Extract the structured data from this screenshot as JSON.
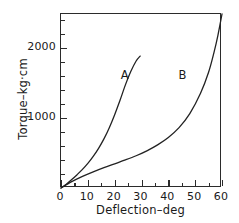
{
  "chart_data": {
    "type": "line",
    "title": "",
    "xlabel": "Deflection–deg",
    "ylabel": "Torque–kg·cm",
    "xlim": [
      0,
      60
    ],
    "ylim": [
      0,
      2480
    ],
    "grid": false,
    "legend": "inline-annotations",
    "xticks": [
      0,
      10,
      20,
      30,
      40,
      50,
      60
    ],
    "xtick_labels": [
      "0",
      "10",
      "20",
      "30",
      "40",
      "50",
      "60"
    ],
    "xminor_ticks": [
      5,
      15,
      25,
      35,
      45,
      55
    ],
    "yticks": [
      1000,
      2000
    ],
    "ytick_labels": [
      "1000",
      "2000"
    ],
    "yminor_ticks": [
      200,
      400,
      600,
      800,
      1200,
      1400,
      1600,
      1800,
      2200,
      2400
    ],
    "line_color": "#222222",
    "series": [
      {
        "name": "A",
        "label": "A",
        "x": [
          0,
          2,
          4,
          6,
          8,
          10,
          12,
          14,
          16,
          18,
          20,
          22,
          24,
          26,
          28,
          29.5
        ],
        "values": [
          0,
          55,
          120,
          190,
          265,
          350,
          450,
          565,
          700,
          860,
          1045,
          1250,
          1470,
          1660,
          1810,
          1880
        ]
      },
      {
        "name": "B",
        "label": "B",
        "x": [
          0,
          4,
          8,
          12,
          16,
          20,
          24,
          28,
          32,
          36,
          40,
          44,
          48,
          52,
          55,
          57,
          58.5,
          60
        ],
        "values": [
          0,
          90,
          165,
          230,
          290,
          345,
          400,
          460,
          530,
          615,
          720,
          860,
          1060,
          1350,
          1650,
          1930,
          2180,
          2480
        ]
      }
    ],
    "annotations": [
      {
        "text": "A",
        "x": 24.5,
        "y": 1600
      },
      {
        "text": "B",
        "x": 46,
        "y": 1600
      }
    ]
  }
}
